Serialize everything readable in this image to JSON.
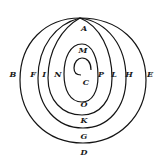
{
  "diagram": {
    "type": "spiral-orbit-figure",
    "stroke_color": "#141414",
    "background": "#ffffff",
    "labels": [
      {
        "id": "A",
        "text": "A",
        "x": 84,
        "y": 28
      },
      {
        "id": "M",
        "text": "M",
        "x": 83,
        "y": 50
      },
      {
        "id": "B",
        "text": "B",
        "x": 13,
        "y": 74
      },
      {
        "id": "F",
        "text": "F",
        "x": 33,
        "y": 74
      },
      {
        "id": "I",
        "text": "I",
        "x": 44,
        "y": 74
      },
      {
        "id": "N",
        "text": "N",
        "x": 58,
        "y": 74
      },
      {
        "id": "C",
        "text": "C",
        "x": 86,
        "y": 82
      },
      {
        "id": "P",
        "text": "P",
        "x": 101,
        "y": 74
      },
      {
        "id": "L",
        "text": "L",
        "x": 114,
        "y": 74
      },
      {
        "id": "H",
        "text": "H",
        "x": 129,
        "y": 74
      },
      {
        "id": "E",
        "text": "E",
        "x": 150,
        "y": 74
      },
      {
        "id": "O",
        "text": "O",
        "x": 84,
        "y": 104
      },
      {
        "id": "K",
        "text": "K",
        "x": 84,
        "y": 120
      },
      {
        "id": "G",
        "text": "G",
        "x": 84,
        "y": 136
      },
      {
        "id": "D",
        "text": "D",
        "x": 84,
        "y": 152
      }
    ]
  }
}
